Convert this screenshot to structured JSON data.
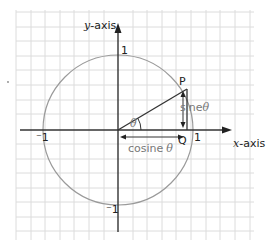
{
  "diagram": {
    "axes": {
      "x_label_var": "x",
      "x_label_suffix": "-axis",
      "y_label_var": "y",
      "y_label_suffix": "-axis"
    },
    "ticks": {
      "x_pos": "1",
      "x_neg": "-1",
      "x_neg_display": "⁻1",
      "y_pos": "1",
      "y_neg_display": "⁻1"
    },
    "points": {
      "P": "P",
      "Q": "Q"
    },
    "angle_symbol": "θ",
    "labels": {
      "sine_word": "sine",
      "cosine_word": "cosine",
      "theta": "θ"
    },
    "colors": {
      "grid": "#d8d8d8",
      "axis": "#333333",
      "circle": "#999999",
      "radius": "#333333",
      "muted_text": "#777777"
    }
  }
}
